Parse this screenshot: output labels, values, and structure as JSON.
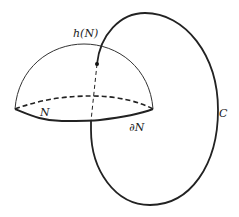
{
  "diagram": {
    "labels": {
      "hemisphere": "h(N)",
      "disk": "N",
      "boundary": "∂N",
      "curve": "C"
    },
    "colors": {
      "stroke": "#222222",
      "background": "#ffffff"
    },
    "elements": [
      {
        "id": "hemisphere",
        "style": "thin solid arc"
      },
      {
        "id": "disk-back-edge",
        "style": "dashed"
      },
      {
        "id": "disk-front-edge",
        "style": "thick solid"
      },
      {
        "id": "curve-C",
        "style": "thick solid closed loop"
      },
      {
        "id": "curve-C-hidden-segment",
        "style": "dashed"
      },
      {
        "id": "intersection-point",
        "style": "filled dot"
      }
    ]
  }
}
